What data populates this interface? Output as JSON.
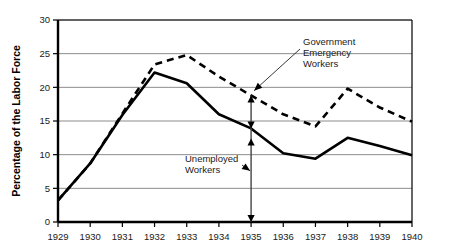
{
  "chart_data": {
    "type": "line",
    "title": "",
    "xlabel": "",
    "ylabel": "Percentage of the Labor Force",
    "x": [
      1929,
      1930,
      1931,
      1932,
      1933,
      1934,
      1935,
      1936,
      1937,
      1938,
      1939,
      1940
    ],
    "xticklabels": [
      "1929",
      "1930",
      "1931",
      "1932",
      "1933",
      "1934",
      "1935",
      "1936",
      "1937",
      "1938",
      "1939",
      "1940"
    ],
    "yticklabels": [
      "0",
      "5",
      "10",
      "15",
      "20",
      "25",
      "30"
    ],
    "ytickvalues": [
      0,
      5,
      10,
      15,
      20,
      25,
      30
    ],
    "xlim": [
      1929,
      1940
    ],
    "ylim": [
      0,
      30
    ],
    "grid": "horizontal",
    "legend_position": "annotations",
    "series": [
      {
        "name": "Unemployed Workers",
        "style": "solid",
        "color": "#000000",
        "values": [
          3.2,
          8.7,
          15.9,
          22.2,
          20.6,
          16.0,
          13.9,
          10.2,
          9.4,
          12.5,
          11.3,
          9.9
        ]
      },
      {
        "name": "Government Emergency Workers",
        "style": "dashed",
        "color": "#000000",
        "values": [
          3.2,
          8.7,
          16.1,
          23.4,
          24.8,
          21.6,
          18.8,
          16.0,
          14.2,
          19.8,
          17.0,
          14.9
        ]
      }
    ],
    "annotations": [
      {
        "name": "government-emergency-workers",
        "text_lines": [
          "Government",
          "Emergency",
          "Workers"
        ],
        "points_to_year": 1935,
        "points_to_value": 19.5
      },
      {
        "name": "unemployed-workers",
        "text_lines": [
          "Unemployed",
          "Workers"
        ],
        "points_to_year": 1935,
        "points_to_value": 7.6
      },
      {
        "name": "gap-arrow-1935",
        "type": "double-arrow",
        "year": 1935,
        "from_value": 0,
        "to_value": 18.8
      }
    ]
  },
  "axis": {
    "y_title": "Percentage of the Labor Force"
  }
}
